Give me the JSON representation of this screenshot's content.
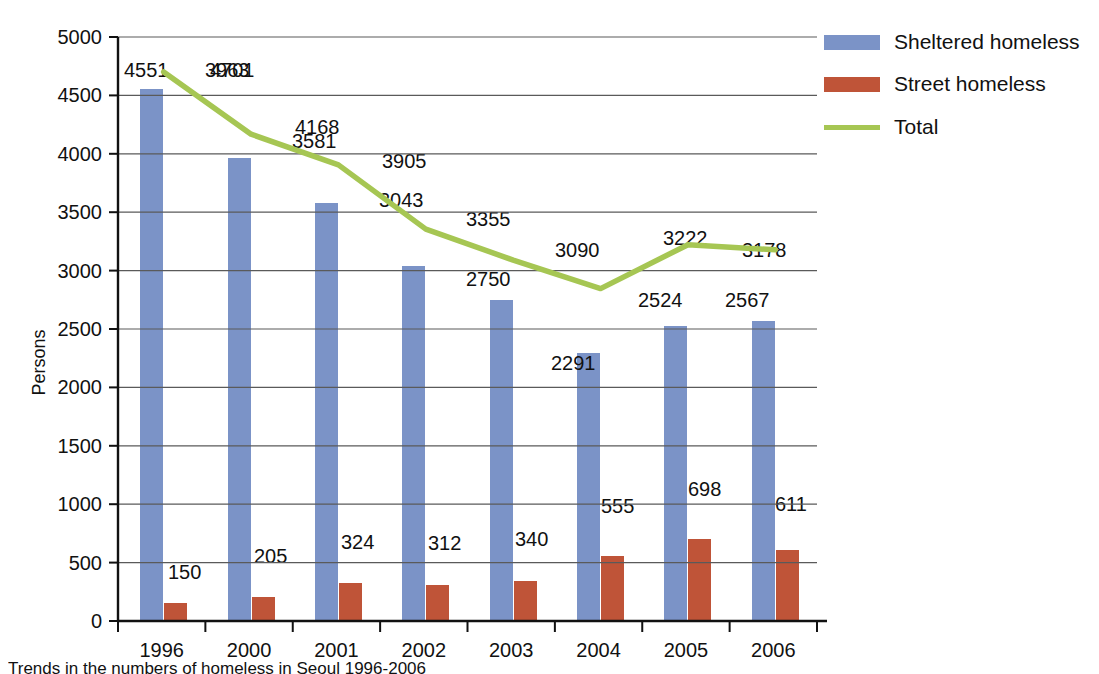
{
  "chart_data": {
    "type": "bar",
    "title": "",
    "xlabel": "",
    "ylabel": "Persons",
    "ylim": [
      0,
      5000
    ],
    "ytick_step": 500,
    "grid": true,
    "legend_position": "top-right",
    "categories": [
      "1996",
      "2000",
      "2001",
      "2002",
      "2003",
      "2004",
      "2005",
      "2006"
    ],
    "series": [
      {
        "name": "Sheltered homeless",
        "type": "bar",
        "color": "#7b93c7",
        "values": [
          4551,
          3963,
          3581,
          3043,
          2750,
          2291,
          2524,
          2567
        ]
      },
      {
        "name": "Street homeless",
        "type": "bar",
        "color": "#bf5438",
        "values": [
          150,
          205,
          324,
          312,
          340,
          555,
          698,
          611
        ]
      },
      {
        "name": "Total",
        "type": "line",
        "color": "#a6c653",
        "values": [
          4701,
          4168,
          3905,
          3355,
          3090,
          2846,
          3222,
          3178
        ]
      }
    ],
    "ytick_labels": [
      "0",
      "500",
      "1000",
      "1500",
      "2000",
      "2500",
      "3000",
      "3500",
      "4000",
      "4500",
      "5000"
    ],
    "annotations": []
  },
  "legend": {
    "items": [
      {
        "label": "Sheltered homeless",
        "color": "#7b93c7",
        "marker": "bar-swatch"
      },
      {
        "label": "Street homeless",
        "color": "#bf5438",
        "marker": "bar-swatch"
      },
      {
        "label": "Total",
        "color": "#a6c653",
        "marker": "line-swatch"
      }
    ]
  },
  "axes": {
    "y_title": "Persons"
  },
  "caption": {
    "text": "Trends in the numbers of homeless in Seoul 1996-2006"
  }
}
